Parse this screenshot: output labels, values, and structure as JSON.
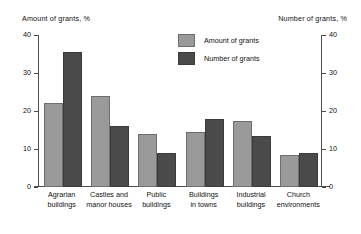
{
  "chart_data": {
    "type": "bar",
    "title": "",
    "subtitle": "",
    "ylabel_left": "Amount of grants, %",
    "ylabel_right": "Number of grants, %",
    "xlabel": "",
    "ylim": [
      0,
      40
    ],
    "yticks": [
      0,
      10,
      20,
      30,
      40
    ],
    "ytick_labels_left": [
      "0",
      "10",
      "20",
      "30",
      "40"
    ],
    "ytick_labels_right": [
      "0",
      "10",
      "20",
      "30",
      "40"
    ],
    "grid": false,
    "legend_position": "upper center",
    "categories": [
      "Agrarian\nbuildings",
      "Castles and\nmanor houses",
      "Public\nbuildings",
      "Buildings\nin towns",
      "Industrial\nbuildings",
      "Church\nenvironments"
    ],
    "category_lines": [
      [
        "Agrarian",
        "buildings"
      ],
      [
        "Castles and",
        "manor houses"
      ],
      [
        "Public",
        "buildings"
      ],
      [
        "Buildings",
        "in towns"
      ],
      [
        "Industrial",
        "buildings"
      ],
      [
        "Church",
        "environments"
      ]
    ],
    "series": [
      {
        "name": "Amount of grants",
        "color": "#9a9a9a",
        "values": [
          22,
          24,
          14,
          14.5,
          17.5,
          8.5
        ]
      },
      {
        "name": "Number of grants",
        "color": "#4a4a4a",
        "values": [
          35.5,
          16,
          9,
          18,
          13.5,
          9
        ]
      }
    ]
  },
  "legend": {
    "items": [
      {
        "label": "Amount of grants"
      },
      {
        "label": "Number of grants"
      }
    ]
  },
  "axes": {
    "left_title": "Amount of grants, %",
    "right_title": "Number of grants, %",
    "ticks": [
      {
        "value": 40,
        "label": "40"
      },
      {
        "value": 30,
        "label": "30"
      },
      {
        "value": 20,
        "label": "20"
      },
      {
        "value": 10,
        "label": "10"
      },
      {
        "value": 0,
        "label": "0"
      }
    ]
  },
  "colors": {
    "amount": "#9a9a9a",
    "number": "#4a4a4a",
    "axis": "#4d4d4d",
    "background": "#ffffff",
    "text": "#111111"
  }
}
